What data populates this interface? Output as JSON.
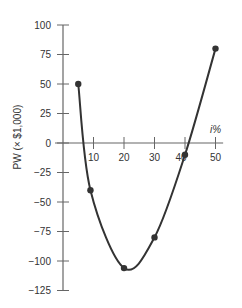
{
  "chart_data": {
    "type": "line",
    "title": "",
    "xlabel": "i%",
    "ylabel": "PW (× $1,000)",
    "xlim": [
      0,
      55
    ],
    "ylim": [
      -125,
      100
    ],
    "x_ticks": [
      10,
      20,
      30,
      40,
      50
    ],
    "x_tick_labels": [
      "10",
      "20",
      "30",
      "40",
      "50"
    ],
    "y_ticks": [
      100,
      75,
      50,
      25,
      0,
      -25,
      -50,
      -75,
      -100,
      -125
    ],
    "y_tick_labels": [
      "100",
      "75",
      "50",
      "25",
      "0",
      "−25",
      "−50",
      "−75",
      "−100",
      "−125"
    ],
    "grid": false,
    "series": [
      {
        "name": "PW",
        "color": "#333333",
        "points": [
          {
            "x": 5,
            "y": 50
          },
          {
            "x": 9,
            "y": -40
          },
          {
            "x": 20,
            "y": -106
          },
          {
            "x": 30,
            "y": -80
          },
          {
            "x": 40,
            "y": -10
          },
          {
            "x": 50,
            "y": 80
          }
        ]
      }
    ]
  }
}
